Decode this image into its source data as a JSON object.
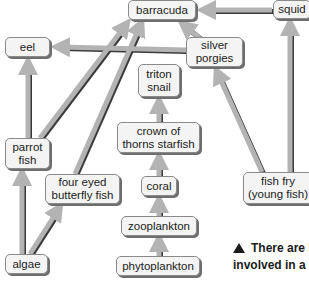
{
  "diagram": {
    "type": "food-web",
    "nodes": {
      "barracuda": "barracuda",
      "squid": "squid",
      "eel": "eel",
      "silver_porgies": [
        "silver",
        "porgies"
      ],
      "triton_snail": [
        "triton",
        "snail"
      ],
      "crown_of_thorns": [
        "crown of",
        "thorns starfish"
      ],
      "parrot_fish": [
        "parrot",
        "fish"
      ],
      "four_eyed_butterfly": [
        "four eyed",
        "butterfly fish"
      ],
      "coral": "coral",
      "zooplankton": "zooplankton",
      "phytoplankton": "phytoplankton",
      "algae": "algae",
      "fish_fry": [
        "fish fry",
        "(young fish)"
      ]
    },
    "edges": [
      {
        "from": "squid",
        "to": "barracuda"
      },
      {
        "from": "silver porgies",
        "to": "barracuda"
      },
      {
        "from": "silver porgies",
        "to": "eel"
      },
      {
        "from": "parrot fish",
        "to": "barracuda"
      },
      {
        "from": "four eyed butterfly fish",
        "to": "barracuda"
      },
      {
        "from": "parrot fish",
        "to": "eel"
      },
      {
        "from": "algae",
        "to": "parrot fish"
      },
      {
        "from": "algae",
        "to": "four eyed butterfly fish"
      },
      {
        "from": "crown of thorns starfish",
        "to": "triton snail"
      },
      {
        "from": "coral",
        "to": "crown of thorns starfish"
      },
      {
        "from": "zooplankton",
        "to": "coral"
      },
      {
        "from": "phytoplankton",
        "to": "zooplankton"
      },
      {
        "from": "fish fry (young fish)",
        "to": "silver porgies"
      },
      {
        "from": "fish fry (young fish)",
        "to": "squid"
      }
    ],
    "colors": {
      "arrow_fill": "#b3b3b3",
      "arrow_shadow": "#3a3a3a",
      "node_fill": "#f4f4f4",
      "node_border": "#8a8a8a"
    }
  },
  "caption": {
    "line1": "There are lot",
    "line2": "involved in a cor"
  }
}
